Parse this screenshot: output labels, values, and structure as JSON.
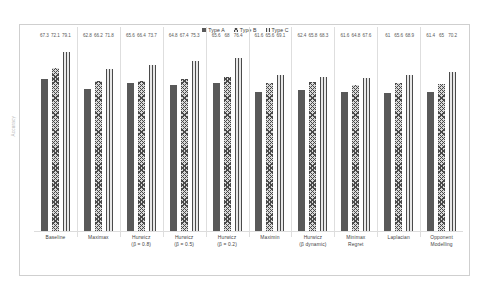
{
  "chart_data": {
    "type": "bar",
    "title": "",
    "xlabel": "",
    "ylabel": "Accuracy",
    "ylim": [
      0,
      85
    ],
    "grid": false,
    "legend_position": "top-center",
    "categories": [
      {
        "line1": "Baseline",
        "line2": ""
      },
      {
        "line1": "Maximax",
        "line2": ""
      },
      {
        "line1": "Hurwicz",
        "line2": "(β = 0.8)"
      },
      {
        "line1": "Hurwicz",
        "line2": "(β = 0.5)"
      },
      {
        "line1": "Hurwicz",
        "line2": "(β = 0.2)"
      },
      {
        "line1": "Maximin",
        "line2": ""
      },
      {
        "line1": "Hurwicz",
        "line2": "(β dynamic)"
      },
      {
        "line1": "Minimax",
        "line2": "Regret"
      },
      {
        "line1": "Laplacian",
        "line2": ""
      },
      {
        "line1": "Opponent",
        "line2": "Modelling"
      }
    ],
    "series": [
      {
        "name": "Type A",
        "pattern": "solid",
        "color": "#595959",
        "values": [
          67.3,
          62.8,
          65.6,
          64.8,
          65.6,
          61.6,
          62.4,
          61.6,
          61,
          61.4
        ]
      },
      {
        "name": "Type B",
        "pattern": "crosshatch",
        "color": "#4a4a4a",
        "values": [
          72.1,
          66.2,
          66.4,
          67.4,
          68,
          65.6,
          65.8,
          64.8,
          65.6,
          65
        ]
      },
      {
        "name": "Type C",
        "pattern": "vertical-stripes",
        "color": "#4a4a4a",
        "values": [
          79.1,
          71.8,
          73.7,
          75.3,
          76.4,
          69.1,
          68.3,
          67.6,
          68.9,
          70.2
        ]
      }
    ]
  }
}
